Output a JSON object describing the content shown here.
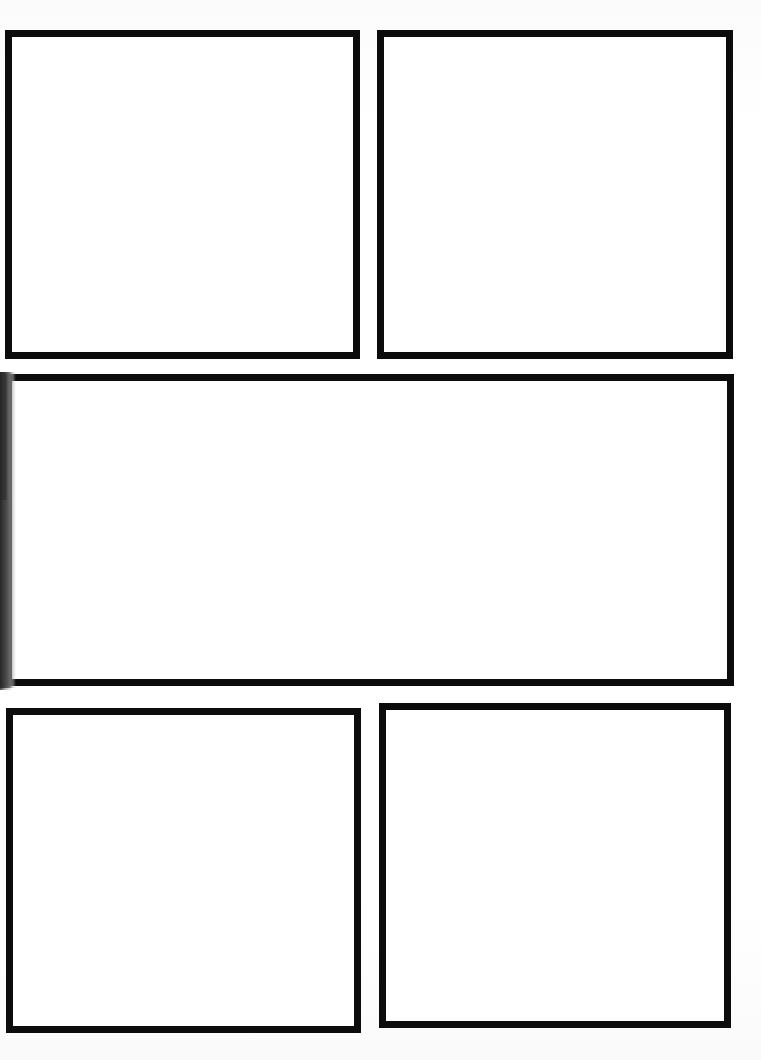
{
  "page": {
    "kind": "blank-comic-page-template",
    "width": 761,
    "height": 1060,
    "background_color": "#fdfdfd",
    "ink_color": "#0c0c0c",
    "panel_fill_color": "#ffffff",
    "panel_count": 5,
    "caption": ""
  },
  "artifacts": {
    "left_edge_bleed": {
      "label": "",
      "color": "#1a1a1a",
      "x": 0,
      "y": 372,
      "width": 16,
      "height": 316
    },
    "left_edge_bleed_soft": {
      "label": "",
      "color": "#3c3c3c",
      "x": 0,
      "y": 500,
      "width": 12,
      "height": 190
    }
  },
  "panels": [
    {
      "id": "panel-1",
      "name": "top-left-panel",
      "row": 1,
      "column": 1,
      "content": "",
      "x": 5,
      "y": 30,
      "width": 355,
      "height": 329,
      "border_width": 7
    },
    {
      "id": "panel-2",
      "name": "top-right-panel",
      "row": 1,
      "column": 2,
      "content": "",
      "x": 377,
      "y": 30,
      "width": 356,
      "height": 329,
      "border_width": 7
    },
    {
      "id": "panel-3",
      "name": "middle-wide-panel",
      "row": 2,
      "column": 1,
      "content": "",
      "x": 5,
      "y": 374,
      "width": 729,
      "height": 312,
      "border_width": 7
    },
    {
      "id": "panel-4",
      "name": "bottom-left-panel",
      "row": 3,
      "column": 1,
      "content": "",
      "x": 6,
      "y": 708,
      "width": 355,
      "height": 325,
      "border_width": 7
    },
    {
      "id": "panel-5",
      "name": "bottom-right-panel",
      "row": 3,
      "column": 2,
      "content": "",
      "x": 379,
      "y": 703,
      "width": 352,
      "height": 325,
      "border_width": 7
    }
  ]
}
